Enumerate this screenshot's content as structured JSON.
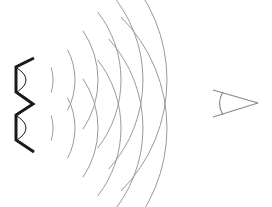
{
  "diagram": {
    "title": "",
    "colors": {
      "background": "#ffffff",
      "source_stroke": "#1a1a1a",
      "wave_stroke": "#9a9a9a",
      "eye_stroke": "#8a8a8a"
    },
    "sources": [
      {
        "name": "upper-source",
        "cx": 10,
        "cy": 80
      },
      {
        "name": "lower-source",
        "cx": 10,
        "cy": 128
      }
    ],
    "wave_radii": [
      43,
      65,
      88,
      111,
      133,
      157
    ],
    "wave_half_angles_deg": [
      17,
      28,
      34,
      38,
      42,
      45
    ],
    "eye": {
      "tip_x": 258,
      "tip_y": 103,
      "back_x": 213,
      "spread": 14
    }
  }
}
